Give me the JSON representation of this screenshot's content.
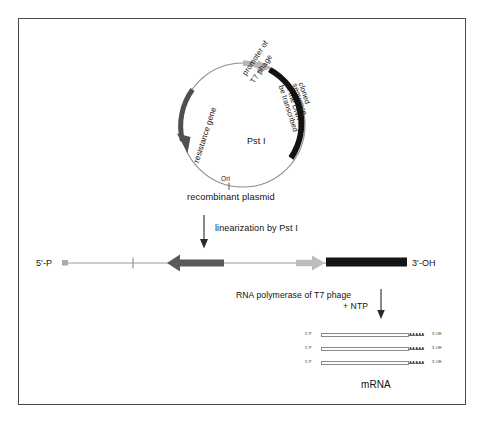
{
  "figure": {
    "title_semantic": "in-vitro-transcription-of-recombinant-plasmid",
    "border_color": "#4a4a4a",
    "background": "#ffffff"
  },
  "plasmid": {
    "caption": "recombinant plasmid",
    "ori_label": "Ori",
    "site_label_italic": "Pst",
    "site_label_plain": " I",
    "features": [
      {
        "name": "resistance-gene",
        "label": "resistance gene",
        "color": "#4f4f4f",
        "shape": "arc-arrow-counterclockwise"
      },
      {
        "name": "t7-promoter",
        "label": "promoter of\nT7 phage",
        "label_line1": "promoter of",
        "label_line2": "T7 phage",
        "color": "#b5b5b5",
        "shape": "arc-arrow-clockwise"
      },
      {
        "name": "cloned-sequence",
        "label_line1": "cloned",
        "label_line2": "sequence",
        "label_line3": "of the DNA to",
        "label_line4": "be transcribed",
        "color": "#111111",
        "shape": "thick-arc"
      }
    ]
  },
  "steps": [
    {
      "name": "linearization",
      "text_plain_before": "linearization by ",
      "text_italic": "Pst",
      "text_plain_after": " I",
      "arrow": "down-arrow"
    },
    {
      "name": "transcription",
      "line1_italic": "RNA polymerase",
      "line1_plain": " of T7 phage",
      "line2": "+ NTP",
      "arrow": "down-arrow"
    }
  ],
  "linear_dna": {
    "left_end_label": "5'-P",
    "right_end_label": "3'-OH",
    "backbone_color": "#9a9a9a",
    "segments": [
      {
        "name": "ori-tick",
        "label": ""
      },
      {
        "name": "resistance-gene-arrow",
        "color": "#5a5a5a",
        "direction": "left"
      },
      {
        "name": "promoter-arrow",
        "color": "#bdbdbd",
        "direction": "right"
      },
      {
        "name": "cloned-sequence-bar",
        "color": "#141414"
      }
    ]
  },
  "mrna": {
    "caption": "mRNA",
    "strand_count": 3,
    "five_prime_label": "5'-P",
    "three_prime_label": "3'-OH",
    "poly_a_tail": "AAAAA",
    "body_color": "#fdfdfd",
    "body_border": "#8a8a8a"
  }
}
